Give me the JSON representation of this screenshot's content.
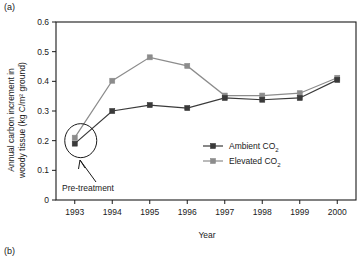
{
  "panels": {
    "a_label": "(a)",
    "b_label": "(b)"
  },
  "chart_data": {
    "type": "line",
    "title": "",
    "xlabel": "Year",
    "ylabel_line1": "Annual carbon increment in",
    "ylabel_line2": "woody tissue (kg C/m² ground)",
    "categories": [
      "1993",
      "1994",
      "1995",
      "1996",
      "1997",
      "1998",
      "1999",
      "2000"
    ],
    "x": [
      1993,
      1994,
      1995,
      1996,
      1997,
      1998,
      1999,
      2000
    ],
    "xlim": [
      1992.5,
      2000.5
    ],
    "ylim": [
      0,
      0.6
    ],
    "ytick_labels": [
      "0.6",
      "0.5",
      "0.4",
      "0.3",
      "0.2",
      "0.1",
      "0"
    ],
    "ytick_values": [
      0.6,
      0.5,
      0.4,
      0.3,
      0.2,
      0.1,
      0
    ],
    "grid": false,
    "legend_position": "inside-center-right",
    "series": [
      {
        "name": "Ambient CO2",
        "label_main": "Ambient CO",
        "label_sub": "2",
        "color": "#3a3a3a",
        "marker": "square",
        "values": [
          0.19,
          0.3,
          0.32,
          0.31,
          0.344,
          0.338,
          0.344,
          0.405
        ]
      },
      {
        "name": "Elevated CO2",
        "label_main": "Elevated CO",
        "label_sub": "2",
        "color": "#8c8c8c",
        "marker": "square",
        "values": [
          0.21,
          0.402,
          0.481,
          0.452,
          0.352,
          0.352,
          0.36,
          0.412
        ]
      }
    ],
    "annotations": [
      {
        "text": "Pre-treatment",
        "target_x": 1993,
        "target_y": 0.2,
        "kind": "circled-callout"
      }
    ]
  }
}
